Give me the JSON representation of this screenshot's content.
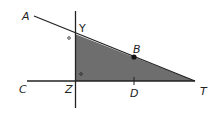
{
  "diagram": {
    "type": "geometry",
    "labels": {
      "A": "A",
      "Y": "Y",
      "B": "B",
      "C": "C",
      "Z": "Z",
      "D": "D",
      "T": "T"
    },
    "colors": {
      "fill": "#6e6e6e",
      "line": "#222222",
      "background": "#ffffff"
    },
    "shaded_region": "triangle YZT",
    "angle_markers": [
      "angle at Y (outside, left)",
      "right angle at Z (inside)"
    ]
  }
}
